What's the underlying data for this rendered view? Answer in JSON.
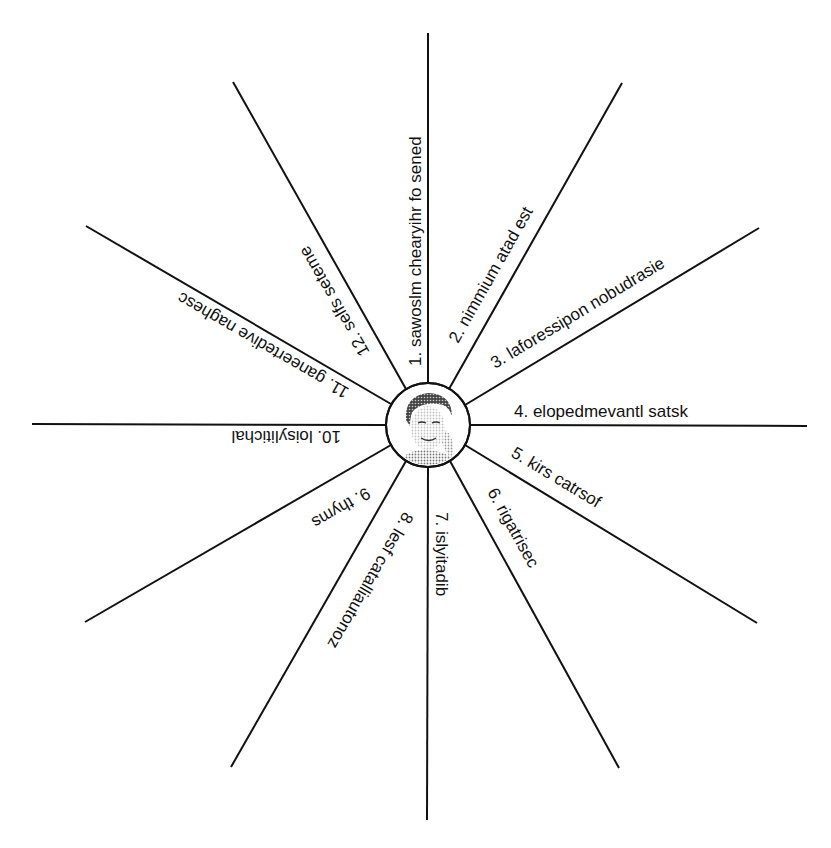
{
  "diagram": {
    "type": "spider-diagram",
    "center": {
      "icon": "portrait-photo",
      "description": "halftone portrait of a woman"
    },
    "spokes": [
      {
        "number": "1",
        "label": "1. sawoslm chearyihr fo sened"
      },
      {
        "number": "2",
        "label": "2. nimmium atad est"
      },
      {
        "number": "3",
        "label": "3. laforessipon nobudrasie"
      },
      {
        "number": "4",
        "label": "4. elopedmevantl satsk"
      },
      {
        "number": "5",
        "label": "5. kirs catrsof"
      },
      {
        "number": "6",
        "label": "6. rigatrisec"
      },
      {
        "number": "7",
        "label": "7. islyitadib"
      },
      {
        "number": "8",
        "label": "8. lesf catalliautonoz"
      },
      {
        "number": "9",
        "label": "9. thyms"
      },
      {
        "number": "10",
        "label": "10. loisylitichal"
      },
      {
        "number": "11",
        "label": "11. ganeertedive naghesc"
      },
      {
        "number": "12",
        "label": "12. selfs seteme"
      }
    ]
  },
  "colors": {
    "line": "#111111",
    "text": "#111111",
    "background": "#ffffff"
  }
}
